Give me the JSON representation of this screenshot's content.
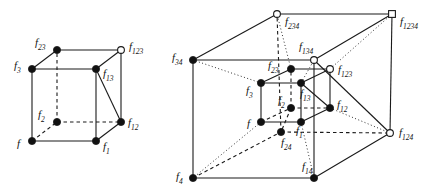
{
  "figure": {
    "background_color": "#ffffff",
    "line_color": "#1a1a1a",
    "node_fill_solid": "#111111",
    "node_fill_open": "#ffffff",
    "width": 438,
    "height": 195
  },
  "cube": {
    "name": "3-cube",
    "nodes": [
      {
        "id": "f",
        "label": "f",
        "sub": "",
        "x": 32,
        "y": 141,
        "style": "solid"
      },
      {
        "id": "f1",
        "label": "f",
        "sub": "1",
        "x": 96,
        "y": 141,
        "style": "solid"
      },
      {
        "id": "f2",
        "label": "f",
        "sub": "2",
        "x": 57,
        "y": 122,
        "style": "solid"
      },
      {
        "id": "f12",
        "label": "f",
        "sub": "12",
        "x": 121,
        "y": 122,
        "style": "solid"
      },
      {
        "id": "f3",
        "label": "f",
        "sub": "3",
        "x": 32,
        "y": 69,
        "style": "solid"
      },
      {
        "id": "f13",
        "label": "f",
        "sub": "13",
        "x": 96,
        "y": 69,
        "style": "solid"
      },
      {
        "id": "f23",
        "label": "f",
        "sub": "23",
        "x": 57,
        "y": 50,
        "style": "solid"
      },
      {
        "id": "f123",
        "label": "f",
        "sub": "123",
        "x": 121,
        "y": 50,
        "style": "open"
      }
    ],
    "labels": [
      {
        "for": "f",
        "text": "f",
        "sub": "",
        "x": 17,
        "y": 147,
        "anchor": "start"
      },
      {
        "for": "f1",
        "text": "f",
        "sub": "1",
        "x": 103,
        "y": 150,
        "anchor": "start"
      },
      {
        "for": "f2",
        "text": "f",
        "sub": "2",
        "x": 38,
        "y": 118,
        "anchor": "start"
      },
      {
        "for": "f12",
        "text": "f",
        "sub": "12",
        "x": 128,
        "y": 126,
        "anchor": "start"
      },
      {
        "for": "f3",
        "text": "f",
        "sub": "3",
        "x": 14,
        "y": 69,
        "anchor": "start"
      },
      {
        "for": "f13",
        "text": "f",
        "sub": "13",
        "x": 103,
        "y": 77,
        "anchor": "start"
      },
      {
        "for": "f23",
        "text": "f",
        "sub": "23",
        "x": 35,
        "y": 46,
        "anchor": "start"
      },
      {
        "for": "f123",
        "text": "f",
        "sub": "123",
        "x": 129,
        "y": 50,
        "anchor": "start"
      }
    ],
    "edges_solid": [
      [
        "f",
        "f1"
      ],
      [
        "f",
        "f3"
      ],
      [
        "f1",
        "f12"
      ],
      [
        "f1",
        "f13"
      ],
      [
        "f3",
        "f13"
      ],
      [
        "f3",
        "f23"
      ],
      [
        "f13",
        "f123"
      ],
      [
        "f23",
        "f123"
      ],
      [
        "f12",
        "f123"
      ],
      [
        "f12",
        "f13"
      ]
    ],
    "edges_dashed": [
      [
        "f",
        "f2"
      ],
      [
        "f2",
        "f12"
      ],
      [
        "f2",
        "f23"
      ]
    ]
  },
  "tesseract": {
    "name": "4-cube",
    "nodes": [
      {
        "id": "f",
        "label": "f",
        "sub": "",
        "x": 261,
        "y": 122,
        "style": "solid"
      },
      {
        "id": "f1",
        "label": "f",
        "sub": "1",
        "x": 301,
        "y": 122,
        "style": "solid"
      },
      {
        "id": "f2",
        "label": "f",
        "sub": "2",
        "x": 291,
        "y": 108,
        "style": "solid"
      },
      {
        "id": "f12",
        "label": "f",
        "sub": "12",
        "x": 330,
        "y": 108,
        "style": "solid"
      },
      {
        "id": "f3",
        "label": "f",
        "sub": "3",
        "x": 261,
        "y": 83,
        "style": "solid"
      },
      {
        "id": "f13",
        "label": "f",
        "sub": "13",
        "x": 301,
        "y": 83,
        "style": "solid"
      },
      {
        "id": "f23",
        "label": "f",
        "sub": "23",
        "x": 291,
        "y": 69,
        "style": "solid"
      },
      {
        "id": "f123",
        "label": "f",
        "sub": "123",
        "x": 330,
        "y": 69,
        "style": "open"
      },
      {
        "id": "f4",
        "label": "f",
        "sub": "4",
        "x": 193,
        "y": 178,
        "style": "solid"
      },
      {
        "id": "f14",
        "label": "f",
        "sub": "14",
        "x": 314,
        "y": 178,
        "style": "solid"
      },
      {
        "id": "f24",
        "label": "f",
        "sub": "24",
        "x": 281,
        "y": 132,
        "style": "solid"
      },
      {
        "id": "f124",
        "label": "f",
        "sub": "124",
        "x": 390,
        "y": 133,
        "style": "open"
      },
      {
        "id": "f34",
        "label": "f",
        "sub": "34",
        "x": 193,
        "y": 60,
        "style": "solid"
      },
      {
        "id": "f134",
        "label": "f",
        "sub": "134",
        "x": 314,
        "y": 60,
        "style": "open"
      },
      {
        "id": "f234",
        "label": "f",
        "sub": "234",
        "x": 277,
        "y": 14,
        "style": "open"
      },
      {
        "id": "f1234",
        "label": "f",
        "sub": "1234",
        "x": 392,
        "y": 14,
        "style": "square"
      }
    ],
    "labels": [
      {
        "for": "f",
        "text": "f",
        "sub": "",
        "x": 247,
        "y": 127,
        "anchor": "start"
      },
      {
        "for": "f1",
        "text": "f",
        "sub": "1",
        "x": 296,
        "y": 134,
        "anchor": "start"
      },
      {
        "for": "f2",
        "text": "f",
        "sub": "2",
        "x": 278,
        "y": 104,
        "anchor": "start"
      },
      {
        "for": "f12",
        "text": "f",
        "sub": "12",
        "x": 337,
        "y": 108,
        "anchor": "start"
      },
      {
        "for": "f3",
        "text": "f",
        "sub": "3",
        "x": 246,
        "y": 94,
        "anchor": "start"
      },
      {
        "for": "f13",
        "text": "f",
        "sub": "13",
        "x": 300,
        "y": 97,
        "anchor": "start"
      },
      {
        "for": "f23",
        "text": "f",
        "sub": "23",
        "x": 268,
        "y": 69,
        "anchor": "start"
      },
      {
        "for": "f123",
        "text": "f",
        "sub": "123",
        "x": 338,
        "y": 73,
        "anchor": "start"
      },
      {
        "for": "f4",
        "text": "f",
        "sub": "4",
        "x": 176,
        "y": 180,
        "anchor": "start"
      },
      {
        "for": "f14",
        "text": "f",
        "sub": "14",
        "x": 302,
        "y": 170,
        "anchor": "start"
      },
      {
        "for": "f24",
        "text": "f",
        "sub": "24",
        "x": 281,
        "y": 146,
        "anchor": "start"
      },
      {
        "for": "f124",
        "text": "f",
        "sub": "124",
        "x": 399,
        "y": 136,
        "anchor": "start"
      },
      {
        "for": "f34",
        "text": "f",
        "sub": "34",
        "x": 172,
        "y": 61,
        "anchor": "start"
      },
      {
        "for": "f134",
        "text": "f",
        "sub": "134",
        "x": 299,
        "y": 50,
        "anchor": "start"
      },
      {
        "for": "f234",
        "text": "f",
        "sub": "234",
        "x": 285,
        "y": 25,
        "anchor": "start"
      },
      {
        "for": "f1234",
        "text": "f",
        "sub": "1234",
        "x": 400,
        "y": 25,
        "anchor": "start"
      }
    ],
    "edges_solid": [
      [
        "f",
        "f1"
      ],
      [
        "f",
        "f3"
      ],
      [
        "f1",
        "f12"
      ],
      [
        "f1",
        "f13"
      ],
      [
        "f3",
        "f13"
      ],
      [
        "f3",
        "f23"
      ],
      [
        "f13",
        "f123"
      ],
      [
        "f23",
        "f123"
      ],
      [
        "f12",
        "f123"
      ],
      [
        "f12",
        "f13"
      ],
      [
        "f4",
        "f14"
      ],
      [
        "f4",
        "f34"
      ],
      [
        "f14",
        "f124"
      ],
      [
        "f14",
        "f134"
      ],
      [
        "f34",
        "f134"
      ],
      [
        "f34",
        "f234"
      ],
      [
        "f134",
        "f1234"
      ],
      [
        "f234",
        "f1234"
      ],
      [
        "f124",
        "f1234"
      ],
      [
        "f124",
        "f134"
      ]
    ],
    "edges_dashed": [
      [
        "f",
        "f2"
      ],
      [
        "f2",
        "f12"
      ],
      [
        "f2",
        "f23"
      ],
      [
        "f4",
        "f24"
      ],
      [
        "f24",
        "f124"
      ],
      [
        "f24",
        "f234"
      ],
      [
        "f2",
        "f24"
      ]
    ],
    "edges_dotted": [
      [
        "f",
        "f4"
      ],
      [
        "f1",
        "f14"
      ],
      [
        "f3",
        "f34"
      ],
      [
        "f12",
        "f124"
      ],
      [
        "f13",
        "f134"
      ],
      [
        "f23",
        "f234"
      ],
      [
        "f123",
        "f1234"
      ]
    ]
  }
}
